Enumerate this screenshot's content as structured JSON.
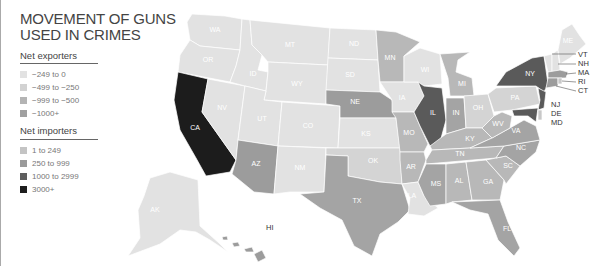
{
  "title_line1": "MOVEMENT OF GUNS",
  "title_line2": "USED IN CRIMES",
  "legend": {
    "exporters_title": "Net exporters",
    "exporters": [
      {
        "label": "−249 to 0",
        "color": "#e0e0e0"
      },
      {
        "label": "−499 to −250",
        "color": "#d0d0d0"
      },
      {
        "label": "−999 to −500",
        "color": "#b4b4b4"
      },
      {
        "label": "−1000+",
        "color": "#a0a0a0"
      }
    ],
    "importers_title": "Net importers",
    "importers": [
      {
        "label": "1 to 249",
        "color": "#c4c4c4"
      },
      {
        "label": "250 to 999",
        "color": "#9a9a9a"
      },
      {
        "label": "1000 to 2999",
        "color": "#5e5e5e"
      },
      {
        "label": "3000+",
        "color": "#1e1e1e"
      }
    ]
  },
  "colors": {
    "c0": "#e2e2e2",
    "c1": "#d4d4d4",
    "c2": "#b8b8b8",
    "c3": "#a4a4a4",
    "i1": "#c8c8c8",
    "i2": "#9c9c9c",
    "i3": "#5a5a5a",
    "i4": "#1c1c1c"
  },
  "states": {
    "WA": "WA",
    "OR": "OR",
    "CA": "CA",
    "NV": "NV",
    "ID": "ID",
    "MT": "MT",
    "WY": "WY",
    "UT": "UT",
    "AZ": "AZ",
    "CO": "CO",
    "NM": "NM",
    "ND": "ND",
    "SD": "SD",
    "NE": "NE",
    "KS": "KS",
    "OK": "OK",
    "TX": "TX",
    "MN": "MN",
    "IA": "IA",
    "MO": "MO",
    "AR": "AR",
    "LA": "LA",
    "WI": "WI",
    "IL": "IL",
    "MI": "MI",
    "IN": "IN",
    "OH": "OH",
    "KY": "KY",
    "TN": "TN",
    "MS": "MS",
    "AL": "AL",
    "GA": "GA",
    "FL": "FL",
    "SC": "SC",
    "NC": "NC",
    "VA": "VA",
    "WV": "WV",
    "PA": "PA",
    "NY": "NY",
    "ME": "ME",
    "AK": "AK",
    "HI": "HI",
    "VT": "VT",
    "NH": "NH",
    "MA": "MA",
    "RI": "RI",
    "CT": "CT",
    "NJ": "NJ",
    "DE": "DE",
    "MD": "MD"
  },
  "map_data": {
    "metric": "net gun flow (exports negative, imports positive)",
    "state_bins": {
      "WA": "-249 to 0",
      "OR": "-249 to 0",
      "NV": "-249 to 0",
      "ID": "-249 to 0",
      "MT": "-249 to 0",
      "WY": "-249 to 0",
      "UT": "-249 to 0",
      "CO": "-249 to 0",
      "NM": "-249 to 0",
      "ND": "-249 to 0",
      "SD": "-249 to 0",
      "KS": "-249 to 0",
      "ME": "-249 to 0",
      "AK": "-249 to 0",
      "WI": "-249 to 0",
      "IA": "-249 to 0",
      "LA": "-249 to 0",
      "OK": "-499 to -250",
      "OH": "-499 to -250",
      "PA": "-499 to -250",
      "VT": "-249 to 0",
      "NH": "-249 to 0",
      "MN": "-999 to -500",
      "NE": "250 to 999",
      "MI": "-999 to -500",
      "KY": "-999 to -500",
      "WV": "-999 to -500",
      "TN": "-999 to -500",
      "VA": "-1000+",
      "NC": "-1000+",
      "SC": "-999 to -500",
      "GA": "-999 to -500",
      "AL": "-999 to -500",
      "AR": "-999 to -500",
      "MO": "-999 to -500",
      "IN": "-1000+",
      "TX": "-1000+",
      "FL": "-1000+",
      "AZ": "-1000+",
      "MS": "-1000+",
      "CA": "3000+",
      "IL": "1000 to 2999",
      "NY": "1000 to 2999",
      "NJ": "1000 to 2999",
      "MA": "250 to 999",
      "RI": "1 to 249",
      "CT": "250 to 999",
      "DE": "1 to 249",
      "MD": "1000 to 2999",
      "HI": "250 to 999"
    }
  }
}
